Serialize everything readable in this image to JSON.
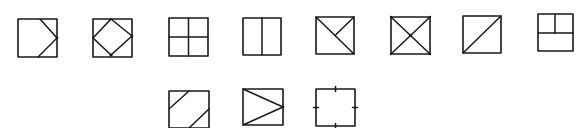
{
  "figure": {
    "stroke_color": "#1a1a1a",
    "background": "#ffffff",
    "rows": [
      {
        "row": 1,
        "items": [
          {
            "id": "fig-1",
            "label": "square-with-right-pointing-chevron",
            "x": 18,
            "y": 19,
            "size": 39
          },
          {
            "id": "fig-2",
            "label": "square-with-inscribed-diamond",
            "x": 93,
            "y": 19,
            "size": 38
          },
          {
            "id": "fig-3",
            "label": "square-quartered-cross",
            "x": 170,
            "y": 18,
            "size": 38
          },
          {
            "id": "fig-4",
            "label": "square-vertical-halves",
            "x": 243,
            "y": 18,
            "size": 38
          },
          {
            "id": "fig-5",
            "label": "square-diagonal-with-half-diagonal",
            "x": 316,
            "y": 17,
            "size": 38
          },
          {
            "id": "fig-6",
            "label": "square-with-x-diagonals",
            "x": 391,
            "y": 17,
            "size": 38
          },
          {
            "id": "fig-7",
            "label": "square-single-diagonal",
            "x": 463,
            "y": 16,
            "size": 37
          },
          {
            "id": "fig-8",
            "label": "square-t-division",
            "x": 538,
            "y": 14,
            "size": 35
          }
        ]
      },
      {
        "row": 2,
        "items": [
          {
            "id": "fig-9",
            "label": "square-two-parallel-diagonal-cuts",
            "x": 170,
            "y": 91,
            "size": 39
          },
          {
            "id": "fig-10",
            "label": "square-with-right-pointing-triangle",
            "x": 243,
            "y": 89,
            "size": 39
          },
          {
            "id": "fig-11",
            "label": "square-with-midpoint-ticks",
            "x": 316,
            "y": 88,
            "size": 38
          }
        ]
      }
    ]
  }
}
